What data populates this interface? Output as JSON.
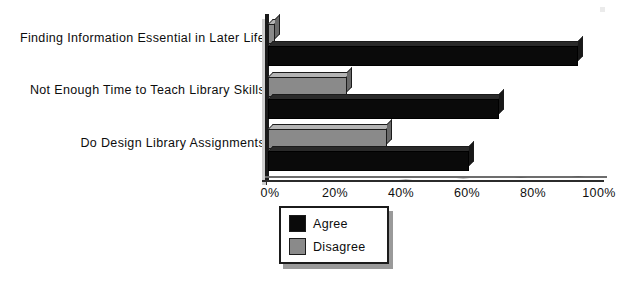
{
  "chart_data": {
    "type": "bar",
    "orientation": "horizontal",
    "title": "",
    "xlabel": "",
    "ylabel": "",
    "categories": [
      "Finding Information Essential in Later Life",
      "Not Enough Time to Teach Library Skills",
      "Do Design Library Assignments"
    ],
    "series": [
      {
        "name": "Agree",
        "color": "#0a0a0a",
        "values": [
          94,
          70,
          61
        ]
      },
      {
        "name": "Disagree",
        "color": "#8a8a8a",
        "values": [
          2,
          24,
          36
        ]
      }
    ],
    "xlim": [
      0,
      100
    ],
    "xticks": [
      0,
      20,
      40,
      60,
      80,
      100
    ],
    "xtick_labels": [
      "0%",
      "20%",
      "40%",
      "60%",
      "80%",
      "100%"
    ],
    "grid": false,
    "legend": {
      "position": "bottom-center",
      "entries": [
        {
          "label": "Agree",
          "color": "#0a0a0a"
        },
        {
          "label": "Disagree",
          "color": "#8a8a8a"
        }
      ]
    },
    "style": "3d-bars"
  }
}
